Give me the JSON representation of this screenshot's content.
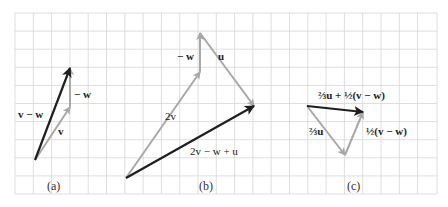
{
  "figure": {
    "grid": {
      "x0": 15,
      "y0": 13,
      "x1": 437,
      "y1": 194,
      "step": 18.1,
      "color": "#d6d6d6"
    },
    "colors": {
      "light_vector": "#a8a8a8",
      "dark_vector": "#1e1e1e"
    },
    "panels": [
      {
        "caption": "(a)",
        "vectors": [
          {
            "label": "v",
            "from": [
              35,
              160
            ],
            "to": [
              70,
              107
            ],
            "style": "light"
          },
          {
            "label": "− w",
            "from": [
              70,
              107
            ],
            "to": [
              70,
              68
            ],
            "style": "light"
          },
          {
            "label": "v − w",
            "from": [
              35,
              160
            ],
            "to": [
              70,
              68
            ],
            "style": "dark"
          }
        ]
      },
      {
        "caption": "(b)",
        "vectors": [
          {
            "label": "2v",
            "from": [
              126,
              178
            ],
            "to": [
              200,
              72
            ],
            "style": "light"
          },
          {
            "label": "− w",
            "from": [
              200,
              72
            ],
            "to": [
              200,
              33
            ],
            "style": "light"
          },
          {
            "label": "u",
            "from": [
              200,
              33
            ],
            "to": [
              254,
              106
            ],
            "style": "light"
          },
          {
            "label": "2v − w + u",
            "from": [
              126,
              178
            ],
            "to": [
              254,
              106
            ],
            "style": "dark"
          }
        ]
      },
      {
        "caption": "(c)",
        "vectors": [
          {
            "label": "⅔u",
            "from": [
              307,
              106
            ],
            "to": [
              345,
              155
            ],
            "style": "light"
          },
          {
            "label": "½(v − w)",
            "from": [
              345,
              155
            ],
            "to": [
              363,
              112
            ],
            "style": "light"
          },
          {
            "label": "⅔u + ½(v − w)",
            "from": [
              307,
              106
            ],
            "to": [
              363,
              112
            ],
            "style": "dark"
          }
        ]
      }
    ]
  },
  "labels": {
    "a_v": "v",
    "a_negw": "− w",
    "a_vminusw": "v − w",
    "a_caption": "(a)",
    "b_2v": "2v",
    "b_negw": "− w",
    "b_u": "u",
    "b_sum": "2v − w + u",
    "b_caption": "(b)",
    "c_23u": "⅔u",
    "c_half": "½(v − w)",
    "c_sum": "⅔u + ½(v − w)",
    "c_caption": "(c)"
  }
}
